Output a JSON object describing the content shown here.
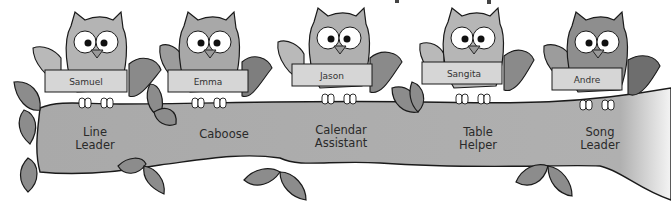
{
  "colors": {
    "branch": "#a9a9a9",
    "branch_outline": "#1a1a1a",
    "leaf": "#8c8c8c",
    "owl_body": "#b4b4b4",
    "owl_dark": "#7a7a7a",
    "sign": "#d6d6d6",
    "background": "#ffffff"
  },
  "helpers": [
    {
      "name": "Samuel",
      "job_line1": "Line",
      "job_line2": "Leader",
      "owl_x": 95,
      "label_x": 95
    },
    {
      "name": "Emma",
      "job_line1": "Caboose",
      "job_line2": "",
      "owl_x": 208,
      "label_x": 224
    },
    {
      "name": "Jason",
      "job_line1": "Calendar",
      "job_line2": "Assistant",
      "owl_x": 338,
      "label_x": 341
    },
    {
      "name": "Sangita",
      "job_line1": "Table",
      "job_line2": "Helper",
      "owl_x": 472,
      "label_x": 478
    },
    {
      "name": "Andre",
      "job_line1": "Song",
      "job_line2": "Leader",
      "owl_x": 596,
      "label_x": 600
    }
  ]
}
